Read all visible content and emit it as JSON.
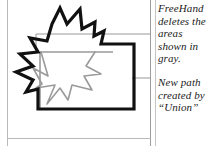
{
  "figure": {
    "kind": "vector-illustration",
    "colors": {
      "outline_black": "#111111",
      "remnant_gray": "#9a9a9a",
      "leader_gray": "#8c8c8c",
      "rule_gray": "#b9b9b9",
      "background": "#ffffff"
    },
    "shapes": [
      {
        "name": "union-outline",
        "label": "black merged star and rectangle outline",
        "stroke": "#111111"
      },
      {
        "name": "deleted-star-remnant",
        "label": "gray star segment inside rectangle",
        "stroke": "#9a9a9a"
      },
      {
        "name": "deleted-rectangle-remnant",
        "label": "gray rectangle segment inside star",
        "stroke": "#9a9a9a"
      }
    ]
  },
  "leaders": [
    {
      "name": "leader-to-deleted-areas",
      "target": "gray overlap region"
    },
    {
      "name": "leader-to-new-path",
      "target": "black union outline"
    }
  ],
  "captions": {
    "delete_note": "FreeHand\ndeletes the\nareas\nshown in\ngray.",
    "union_note": "New path\ncreated by\n“Union”"
  }
}
